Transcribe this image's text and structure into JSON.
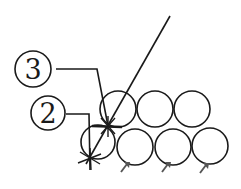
{
  "diagram": {
    "labels": [
      {
        "id": "label-3",
        "text": "3",
        "cx": 33,
        "cy": 69,
        "r": 18
      },
      {
        "id": "label-2",
        "text": "2",
        "cx": 48,
        "cy": 113,
        "r": 17
      }
    ],
    "top_row_circles": [
      {
        "cx": 118,
        "cy": 109,
        "r": 18
      },
      {
        "cx": 155,
        "cy": 109,
        "r": 18
      },
      {
        "cx": 192,
        "cy": 109,
        "r": 18
      }
    ],
    "bottom_row_circles": [
      {
        "cx": 98,
        "cy": 142,
        "r": 18
      },
      {
        "cx": 135,
        "cy": 147,
        "r": 18
      },
      {
        "cx": 173,
        "cy": 147,
        "r": 18
      },
      {
        "cx": 210,
        "cy": 146,
        "r": 18
      }
    ],
    "arrows": [
      {
        "x": 125,
        "y": 166
      },
      {
        "x": 166,
        "y": 166
      },
      {
        "x": 203,
        "y": 166
      }
    ],
    "colors": {
      "line": "#1a1a1a",
      "arrow": "#555555",
      "background": "#ffffff"
    }
  }
}
